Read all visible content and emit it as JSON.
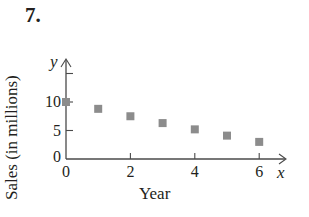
{
  "problem_number": "7.",
  "chart_data": {
    "type": "scatter",
    "title": "",
    "xlabel": "Year",
    "ylabel": "Sales (in millions)",
    "x_axis_var": "x",
    "y_axis_var": "y",
    "x": [
      0,
      1,
      2,
      3,
      4,
      5,
      6
    ],
    "values": [
      10,
      8.8,
      7.5,
      6.3,
      5.2,
      4.1,
      3.0
    ],
    "x_ticks": [
      "0",
      "2",
      "4",
      "6"
    ],
    "y_ticks": [
      "0",
      "5",
      "10"
    ],
    "xlim": [
      0,
      7
    ],
    "ylim": [
      0,
      15
    ],
    "grid": false,
    "marker": "square",
    "marker_color": "#8c8c8c"
  }
}
